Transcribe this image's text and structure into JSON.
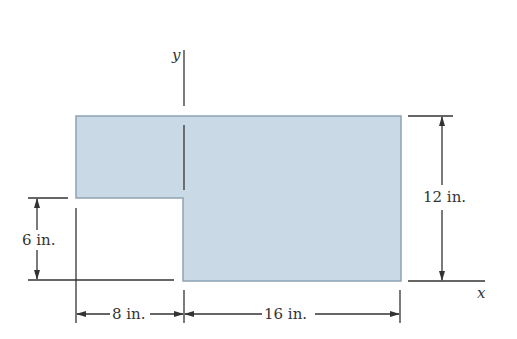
{
  "figure": {
    "colors": {
      "fill": "#c9d9e5",
      "stroke": "#8fa3b3",
      "ink": "#333333"
    },
    "axes": {
      "x_label": "x",
      "y_label": "y"
    },
    "dimensions": {
      "left_width": "8 in.",
      "right_width": "16 in.",
      "total_height": "12 in.",
      "notch_height": "6 in."
    }
  }
}
